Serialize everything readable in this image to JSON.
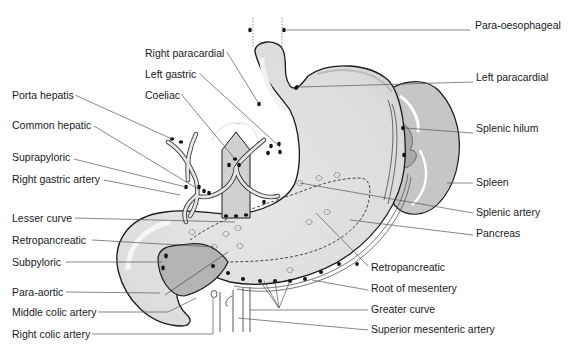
{
  "diagram": {
    "colors": {
      "organ_fill": "#e2e2e2",
      "organ_light": "#f4f4f4",
      "pancreas_fill": "#b4b4b4",
      "spleen_fill": "#c6c6c6",
      "outline": "#1a1a1a",
      "leader": "#555555",
      "node": "#111111"
    },
    "labels_left": [
      {
        "id": "right-paracardial",
        "text": "Right paracardial"
      },
      {
        "id": "left-gastric",
        "text": "Left gastric"
      },
      {
        "id": "porta-hepatis",
        "text": "Porta hepatis"
      },
      {
        "id": "coeliac",
        "text": "Coeliac"
      },
      {
        "id": "common-hepatic",
        "text": "Common hepatic"
      },
      {
        "id": "suprapyloric",
        "text": "Suprapyloric"
      },
      {
        "id": "right-gastric-artery",
        "text": "Right gastric artery"
      },
      {
        "id": "lesser-curve",
        "text": "Lesser curve"
      },
      {
        "id": "retropancreatic-left",
        "text": "Retropancreatic"
      },
      {
        "id": "subpyloric",
        "text": "Subpyloric"
      },
      {
        "id": "para-aortic",
        "text": "Para-aortic"
      },
      {
        "id": "middle-colic-artery",
        "text": "Middle colic artery"
      },
      {
        "id": "right-colic-artery",
        "text": "Right colic artery"
      }
    ],
    "labels_right": [
      {
        "id": "para-oesophageal",
        "text": "Para-oesophageal"
      },
      {
        "id": "left-paracardial",
        "text": "Left paracardial"
      },
      {
        "id": "splenic-hilum",
        "text": "Splenic hilum"
      },
      {
        "id": "spleen",
        "text": "Spleen"
      },
      {
        "id": "splenic-artery",
        "text": "Splenic artery"
      },
      {
        "id": "pancreas",
        "text": "Pancreas"
      },
      {
        "id": "retropancreatic-right",
        "text": "Retropancreatic"
      },
      {
        "id": "root-of-mesentery",
        "text": "Root of mesentery"
      },
      {
        "id": "greater-curve",
        "text": "Greater curve"
      },
      {
        "id": "superior-mesenteric-artery",
        "text": "Superior mesenteric artery"
      }
    ]
  }
}
